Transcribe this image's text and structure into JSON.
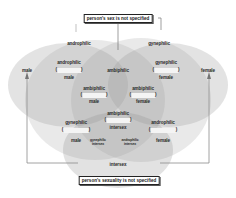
{
  "diagram": {
    "top_box": "person's sex is not specified",
    "bottom_box": "person's sexuality is not specified",
    "sets": {
      "androphilic": "androphilic",
      "gynephilic": "gynephilic",
      "male": "male",
      "female": "female",
      "ambiphilic": "ambiphilic",
      "intersex": "intersex"
    },
    "regions": {
      "androphilic_male": {
        "top": "androphilic",
        "paren": "homosexual",
        "bottom": "male"
      },
      "gynephilic_female": {
        "top": "gynephilic",
        "paren": "homosexual",
        "bottom": "female"
      },
      "ambiphilic_male": {
        "top": "ambiphilic",
        "paren": "bisexual",
        "bottom": "male"
      },
      "ambiphilic_female": {
        "top": "ambiphilic",
        "paren": "bisexual",
        "bottom": "female"
      },
      "ambiphilic_intersex": {
        "top": "ambiphilic",
        "paren": "bisexual",
        "bottom": "intersex"
      },
      "gynephilic_male": {
        "top": "gynephilic",
        "paren": "heterosexual",
        "bottom": "male"
      },
      "androphilic_female": {
        "top": "androphilic",
        "paren": "heterosexual",
        "bottom": "female"
      },
      "gynephilic_intersex": {
        "line1": "gynephilic",
        "line2": "intersex"
      },
      "androphilic_intersex": {
        "line1": "androphilic",
        "line2": "intersex"
      },
      "intersex_only": "intersex"
    },
    "colors": {
      "shape_fill": "#9a9a9a",
      "text": "#2a2a2a",
      "line": "#888888"
    }
  }
}
